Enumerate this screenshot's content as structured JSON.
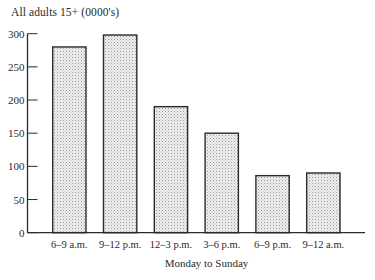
{
  "chart_data": {
    "type": "bar",
    "title": "All adults 15+ (0000's)",
    "xlabel": "Monday to Sunday",
    "ylabel": "All adults 15+ (0000's)",
    "categories": [
      "6–9 a.m.",
      "9–12 p.m.",
      "12–3 p.m.",
      "3–6 p.m.",
      "6–9 p.m.",
      "9–12 a.m."
    ],
    "values": [
      280,
      298,
      190,
      150,
      86,
      90
    ],
    "ylim": [
      0,
      300
    ],
    "yticks": [
      0,
      50,
      100,
      150,
      200,
      250,
      300
    ],
    "grid": false,
    "legend": null,
    "bar_fill": "stippled light gray",
    "colors": {
      "bar_fill": "#e4e4e4",
      "bar_stipple": "#9a9a9a",
      "bar_outline": "#2a2a2a",
      "axis": "#2a2a2a",
      "background": "#ffffff"
    }
  }
}
